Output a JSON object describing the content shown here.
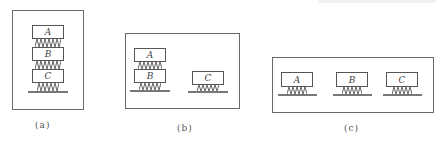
{
  "figure": {
    "panels": [
      {
        "id": "a",
        "caption": "(a)",
        "arrangement": "A stacked on B stacked on C on ground",
        "blocks": [
          "A",
          "B",
          "C"
        ]
      },
      {
        "id": "b",
        "caption": "(b)",
        "arrangement": "A stacked on B on ground; C separate on ground",
        "blocks": [
          "A",
          "B",
          "C"
        ]
      },
      {
        "id": "c",
        "caption": "(c)",
        "arrangement": "A, B, C each separately on ground",
        "blocks": [
          "A",
          "B",
          "C"
        ]
      }
    ],
    "colors": {
      "line": "#555555",
      "frame": "#6a6a6a",
      "ground": "#777777",
      "text": "#444444"
    }
  }
}
